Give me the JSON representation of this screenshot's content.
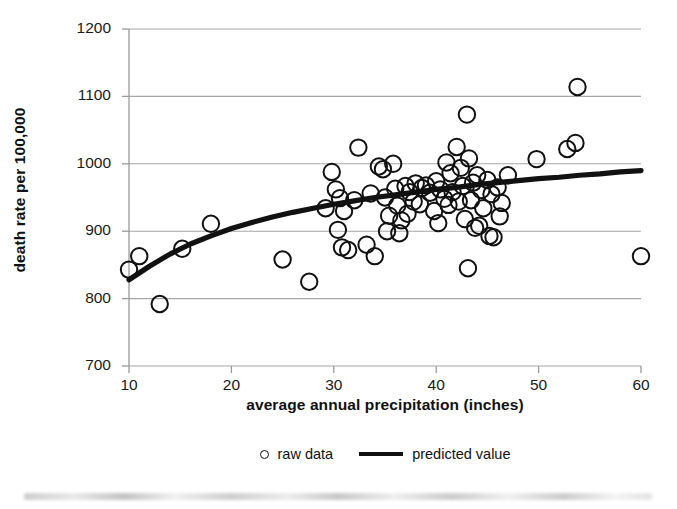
{
  "chart_data": {
    "type": "scatter",
    "title": "",
    "xlabel": "average annual precipitation (inches)",
    "ylabel": "death rate per 100,000",
    "xlim": [
      10,
      60
    ],
    "ylim": [
      700,
      1200
    ],
    "xticks": [
      10,
      20,
      30,
      40,
      50,
      60
    ],
    "yticks": [
      700,
      800,
      900,
      1000,
      1100,
      1200
    ],
    "grid": "horizontal",
    "legend_position": "bottom-center",
    "marker_color": "#111111",
    "line_color": "#111111",
    "grid_color": "#a6a6a6",
    "series": [
      {
        "name": "raw data",
        "type": "scatter",
        "marker": "open-circle",
        "points": [
          [
            10.0,
            843
          ],
          [
            11.0,
            863
          ],
          [
            13.0,
            792
          ],
          [
            15.2,
            874
          ],
          [
            18.0,
            911
          ],
          [
            25.0,
            858
          ],
          [
            27.6,
            825
          ],
          [
            29.2,
            934
          ],
          [
            29.8,
            988
          ],
          [
            30.2,
            962
          ],
          [
            30.6,
            949
          ],
          [
            30.4,
            902
          ],
          [
            30.8,
            876
          ],
          [
            31.4,
            872
          ],
          [
            31.0,
            930
          ],
          [
            32.4,
            1024
          ],
          [
            32.0,
            946
          ],
          [
            33.2,
            880
          ],
          [
            33.6,
            956
          ],
          [
            34.0,
            863
          ],
          [
            34.4,
            996
          ],
          [
            34.8,
            992
          ],
          [
            35.0,
            950
          ],
          [
            35.4,
            923
          ],
          [
            35.2,
            900
          ],
          [
            35.8,
            1000
          ],
          [
            36.0,
            963
          ],
          [
            36.2,
            938
          ],
          [
            36.6,
            916
          ],
          [
            36.4,
            897
          ],
          [
            37.0,
            967
          ],
          [
            37.4,
            958
          ],
          [
            37.8,
            944
          ],
          [
            37.2,
            926
          ],
          [
            38.0,
            971
          ],
          [
            38.6,
            964
          ],
          [
            38.4,
            940
          ],
          [
            39.0,
            968
          ],
          [
            39.4,
            957
          ],
          [
            39.8,
            930
          ],
          [
            40.0,
            974
          ],
          [
            40.4,
            962
          ],
          [
            40.8,
            948
          ],
          [
            40.2,
            912
          ],
          [
            41.0,
            1002
          ],
          [
            41.4,
            986
          ],
          [
            41.6,
            958
          ],
          [
            41.2,
            939
          ],
          [
            42.0,
            1025
          ],
          [
            42.4,
            994
          ],
          [
            42.6,
            967
          ],
          [
            42.2,
            944
          ],
          [
            42.8,
            918
          ],
          [
            43.0,
            1073
          ],
          [
            43.2,
            1008
          ],
          [
            43.6,
            972
          ],
          [
            43.4,
            946
          ],
          [
            43.8,
            905
          ],
          [
            43.1,
            845
          ],
          [
            44.0,
            983
          ],
          [
            44.4,
            961
          ],
          [
            44.6,
            934
          ],
          [
            44.2,
            908
          ],
          [
            45.0,
            976
          ],
          [
            45.4,
            955
          ],
          [
            45.2,
            893
          ],
          [
            45.6,
            891
          ],
          [
            46.0,
            965
          ],
          [
            46.4,
            942
          ],
          [
            46.2,
            922
          ],
          [
            47.0,
            983
          ],
          [
            49.8,
            1007
          ],
          [
            52.8,
            1022
          ],
          [
            53.6,
            1031
          ],
          [
            53.8,
            1114
          ],
          [
            60.0,
            863
          ]
        ]
      },
      {
        "name": "predicted value",
        "type": "line",
        "points": [
          [
            10,
            828
          ],
          [
            12,
            848
          ],
          [
            14,
            866
          ],
          [
            16,
            881
          ],
          [
            18,
            893
          ],
          [
            20,
            904
          ],
          [
            22,
            913
          ],
          [
            24,
            921
          ],
          [
            26,
            928
          ],
          [
            28,
            934
          ],
          [
            30,
            940
          ],
          [
            32,
            945
          ],
          [
            34,
            950
          ],
          [
            36,
            954
          ],
          [
            38,
            958
          ],
          [
            40,
            962
          ],
          [
            42,
            965
          ],
          [
            44,
            969
          ],
          [
            46,
            972
          ],
          [
            48,
            975
          ],
          [
            50,
            978
          ],
          [
            52,
            980
          ],
          [
            54,
            983
          ],
          [
            56,
            985
          ],
          [
            58,
            988
          ],
          [
            60,
            990
          ]
        ]
      }
    ]
  },
  "legend": {
    "raw_data_label": "raw data",
    "predicted_label": "predicted value"
  }
}
